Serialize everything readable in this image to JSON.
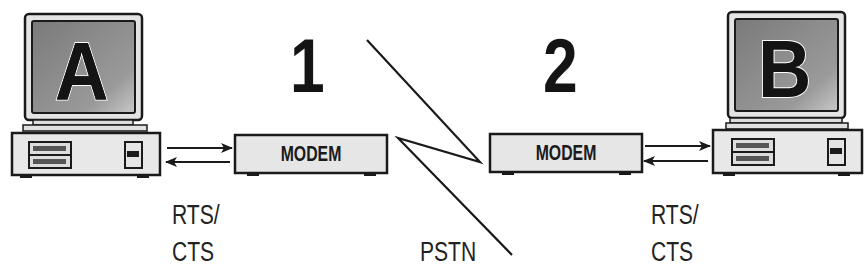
{
  "diagram": {
    "type": "modem-link",
    "nodes": {
      "computer_a": {
        "letter": "A"
      },
      "computer_b": {
        "letter": "B"
      },
      "modem_1": {
        "label": "MODEM",
        "number": "1"
      },
      "modem_2": {
        "label": "MODEM",
        "number": "2"
      }
    },
    "labels": {
      "left_flow_line1": "RTS/",
      "left_flow_line2": "CTS",
      "right_flow_line1": "RTS/",
      "right_flow_line2": "CTS",
      "network": "PSTN"
    },
    "colors": {
      "stroke": "#1a1a1a",
      "case_fill": "#e6e6e6",
      "screen_fill": "#8c8c8c"
    }
  }
}
